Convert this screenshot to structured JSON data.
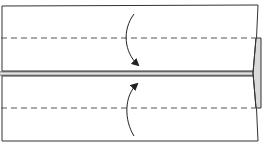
{
  "diagram": {
    "type": "origami-fold-diagram",
    "colors": {
      "line": "#222222",
      "dash": "#555555",
      "flap_fill": "#d9d9d9",
      "paper": "#ffffff"
    },
    "fold_lines": [
      {
        "name": "top-valley-fold",
        "style": "dashed",
        "y": 38
      },
      {
        "name": "bottom-valley-fold",
        "style": "dashed",
        "y": 108
      }
    ],
    "center_crease": {
      "y_top": 72,
      "y_bottom": 75
    },
    "arrows": [
      {
        "name": "fold-down-arrow",
        "direction": "down"
      },
      {
        "name": "fold-up-arrow",
        "direction": "up"
      }
    ]
  }
}
